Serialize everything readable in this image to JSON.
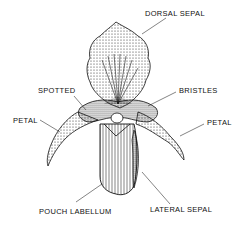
{
  "diagram": {
    "labels": {
      "dorsal_sepal": "DORSAL SEPAL",
      "spotted": "SPOTTED",
      "bristles": "BRISTLES",
      "petal_left": "PETAL",
      "petal_right": "PETAL",
      "pouch_labellum": "POUCH LABELLUM",
      "lateral_sepal": "LATERAL SEPAL"
    },
    "colors": {
      "ink": "#111111",
      "background": "#ffffff"
    }
  }
}
